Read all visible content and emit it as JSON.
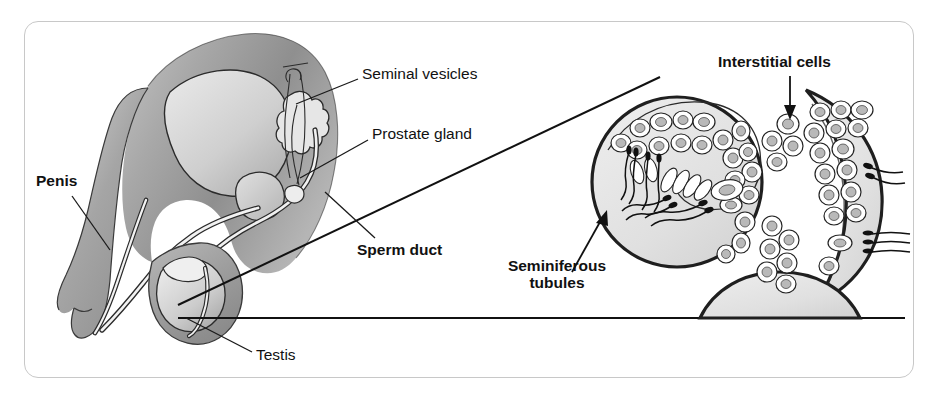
{
  "figure": {
    "kind": "anatomical-diagram",
    "frame": {
      "border_color": "#c8c8c8",
      "background_color": "#ffffff"
    },
    "palette": {
      "outline": "#1a1a1a",
      "tissue_mid_gray": "#9a9a9a",
      "tissue_light_gray": "#c9c9c9",
      "organ_pale_gray": "#dcdcdc",
      "highlight_white": "#f2f2f2",
      "tubule_fill": "#e2e2e2",
      "cell_fill": "#ffffff",
      "nucleus_fill": "#b9b9b9",
      "leader_line": "#1a1a1a",
      "magnify_line": "#111111"
    },
    "labels": [
      {
        "id": "penis",
        "text": "Penis",
        "weight": "bold",
        "x": 36,
        "y": 172,
        "leader": {
          "from": [
            72,
            196
          ],
          "to": [
            110,
            250
          ]
        }
      },
      {
        "id": "seminal-vesicles",
        "text": "Seminal vesicles",
        "weight": "regular",
        "x": 362,
        "y": 65,
        "leader": {
          "from": [
            358,
            79
          ],
          "to": [
            296,
            104
          ]
        }
      },
      {
        "id": "prostate-gland",
        "text": "Prostate gland",
        "weight": "regular",
        "x": 372,
        "y": 125,
        "leader": {
          "from": [
            368,
            140
          ],
          "to": [
            300,
            178
          ]
        }
      },
      {
        "id": "sperm-duct",
        "text": "Sperm duct",
        "weight": "bold",
        "x": 357,
        "y": 241,
        "leader": {
          "from": [
            375,
            238
          ],
          "to": [
            325,
            192
          ]
        }
      },
      {
        "id": "testis",
        "text": "Testis",
        "weight": "regular",
        "x": 256,
        "y": 346,
        "leader": {
          "from": [
            252,
            352
          ],
          "to": [
            186,
            318
          ]
        }
      },
      {
        "id": "interstitial-cells",
        "text": "Interstitial cells",
        "weight": "bold",
        "x": 718,
        "y": 53,
        "arrow": {
          "from": [
            790,
            76
          ],
          "to": [
            790,
            116
          ]
        }
      },
      {
        "id": "seminiferous-tubules",
        "text": "Seminiferous\ntubules",
        "weight": "bold",
        "x": 477,
        "y": 257,
        "arrow": {
          "from": [
            575,
            269
          ],
          "to": [
            606,
            214
          ]
        }
      }
    ],
    "magnification_lines": [
      {
        "from": [
          178,
          305
        ],
        "to": [
          660,
          77
        ]
      },
      {
        "from": [
          178,
          318
        ],
        "to": [
          905,
          318
        ]
      }
    ],
    "anatomy_parts": [
      "bladder",
      "pelvic-tissue",
      "penis-shaft",
      "urethra",
      "prostate-gland",
      "seminal-vesicle",
      "sperm-duct",
      "testis",
      "epididymis",
      "scrotum"
    ],
    "micrograph_parts": [
      "seminiferous-tubule-left",
      "seminiferous-tubule-right",
      "seminiferous-tubule-bottom",
      "interstitial-cell-cluster-upper",
      "interstitial-cell-cluster-lower",
      "germ-cells",
      "spermatozoa"
    ]
  }
}
